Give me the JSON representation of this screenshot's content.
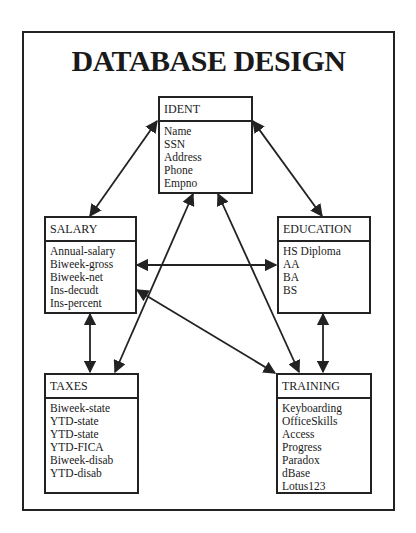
{
  "title": "DATABASE DESIGN",
  "entities": {
    "ident": {
      "name": "IDENT",
      "fields": [
        "Name",
        "SSN",
        "Address",
        "Phone",
        "Empno"
      ]
    },
    "salary": {
      "name": "SALARY",
      "fields": [
        "Annual-salary",
        "Biweek-gross",
        "Biweek-net",
        "Ins-decudt",
        "Ins-percent"
      ]
    },
    "education": {
      "name": "EDUCATION",
      "fields": [
        "HS Diploma",
        "AA",
        "BA",
        "BS"
      ]
    },
    "taxes": {
      "name": "TAXES",
      "fields": [
        "Biweek-state",
        "YTD-state",
        "YTD-state",
        "YTD-FICA",
        "Biweek-disab",
        "YTD-disab"
      ]
    },
    "training": {
      "name": "TRAINING",
      "fields": [
        "Keyboarding",
        "OfficeSkills",
        "Access",
        "Progress",
        "Paradox",
        "dBase",
        "Lotus123"
      ]
    }
  },
  "relationships": [
    {
      "from": "IDENT",
      "to": "SALARY",
      "type": "bidirectional"
    },
    {
      "from": "IDENT",
      "to": "EDUCATION",
      "type": "bidirectional"
    },
    {
      "from": "IDENT",
      "to": "TAXES",
      "type": "bidirectional"
    },
    {
      "from": "IDENT",
      "to": "TRAINING",
      "type": "bidirectional"
    },
    {
      "from": "SALARY",
      "to": "EDUCATION",
      "type": "bidirectional"
    },
    {
      "from": "SALARY",
      "to": "TRAINING",
      "type": "bidirectional"
    },
    {
      "from": "SALARY",
      "to": "TAXES",
      "type": "bidirectional"
    },
    {
      "from": "EDUCATION",
      "to": "TRAINING",
      "type": "bidirectional"
    }
  ],
  "colors": {
    "line": "#222222",
    "background": "#ffffff",
    "text": "#1a1a1a"
  }
}
